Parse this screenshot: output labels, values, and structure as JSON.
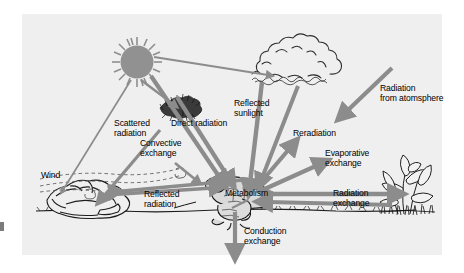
{
  "figure": {
    "panel_bg": "#efefef",
    "page_bg": "#ffffff",
    "arrow_color": "#8c8c8c",
    "ink_color": "#1a1a1a"
  },
  "labels": {
    "scattered_radiation": "Scattered\nradiation",
    "direct_radiation": "Direct radiation",
    "convective_exchange": "Convective\nexchange",
    "wind": "Wind",
    "reflected_radiation": "Reflected\nradiation",
    "reflected_sunlight": "Reflected\nsunlight",
    "reradiation": "Reradiation",
    "evaporative_exchange": "Evaporative\nexchange",
    "radiation_exchange": "Radiation\nexchange",
    "radiation_from_atmosphere": "Radiation\nfrom atomsphere",
    "metabolism": "Metabolism",
    "conduction_exchange": "Conduction\nexchange"
  },
  "objects": {
    "sun": "sun-icon",
    "cloud": "cloud-icon",
    "shrub": "shrub-icon",
    "rock": "rock-icon",
    "frog": "frog-icon",
    "plant": "plant-icon",
    "ground": "ground-line"
  },
  "flows": [
    {
      "name": "direct-radiation",
      "from": "sun",
      "to": "frog",
      "heads": 1
    },
    {
      "name": "scattered-radiation",
      "from": "sun",
      "to": "shrub",
      "heads": 1
    },
    {
      "name": "sun-to-cloud",
      "from": "sun",
      "to": "cloud",
      "heads": 1
    },
    {
      "name": "sun-to-rock",
      "from": "sun",
      "to": "rock",
      "heads": 1
    },
    {
      "name": "reflected-sunlight",
      "from": "cloud",
      "to": "frog",
      "heads": 1
    },
    {
      "name": "radiation-from-atmosphere",
      "from": "atmosphere",
      "to": "frog",
      "heads": 1
    },
    {
      "name": "reflected-radiation",
      "from": "rock",
      "to": "frog",
      "heads": 1
    },
    {
      "name": "convective-exchange",
      "from": "air",
      "to": "frog",
      "heads": 1
    },
    {
      "name": "reradiation",
      "from": "frog",
      "to": "sky",
      "heads": 1
    },
    {
      "name": "evaporative-exchange",
      "from": "frog",
      "to": "air",
      "heads": 1
    },
    {
      "name": "radiation-exchange",
      "from": "frog",
      "to": "plant",
      "heads": 2
    },
    {
      "name": "conduction-exchange",
      "from": "frog",
      "to": "ground",
      "heads": 1
    }
  ]
}
